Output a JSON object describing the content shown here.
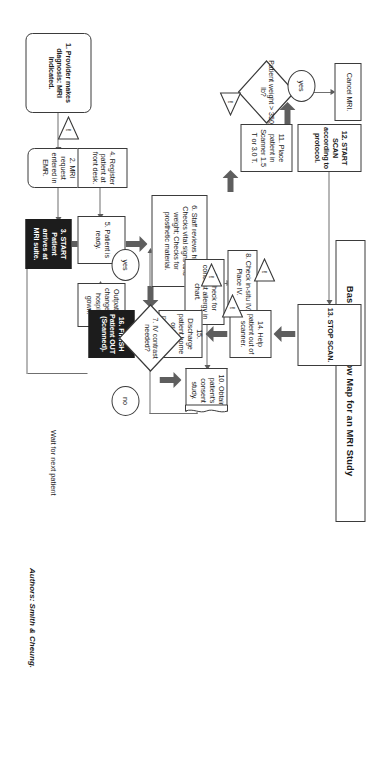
{
  "document": {
    "title": "Basic Process Flow Map for an MRI Study",
    "authors": "Authors: Smith & Cheung.",
    "loop_label": "Wait for next patient"
  },
  "icons": {
    "warning": "!"
  },
  "nodes": [
    {
      "id": "n1",
      "name": "step-1-provider-diagnosis",
      "text": "1. Provider makes diagnosis: MRI Indicated.",
      "shape": "rounded",
      "emphasis": "bold"
    },
    {
      "id": "n2",
      "name": "step-2-mri-request-emr",
      "text": "2. MRI request entered in EMR.",
      "shape": "rounded",
      "emphasis": "normal"
    },
    {
      "id": "n3",
      "name": "step-3-start-patient-arrives",
      "text": "3. START Patient arrives at MRI suite.",
      "shape": "rect",
      "emphasis": "black"
    },
    {
      "id": "n4",
      "name": "step-4-register-front-desk",
      "text": "4. Register patient at front desk.",
      "shape": "rect",
      "emphasis": "normal"
    },
    {
      "id": "n5",
      "name": "step-5-patient-ready",
      "text": "5. Patient is ready.",
      "shape": "rect",
      "emphasis": "normal"
    },
    {
      "id": "nOut",
      "name": "outpatient-gown-change",
      "text": "Outpatient changes to hospital gown.",
      "shape": "rect",
      "emphasis": "normal"
    },
    {
      "id": "n6",
      "name": "step-6-staff-reviews",
      "text": "6. Staff reviews history; Checks vital signs and weight; Checks for prosthetic material.",
      "shape": "rect",
      "emphasis": "normal"
    },
    {
      "id": "n8",
      "name": "step-8-check-iv",
      "text": "8. Check in-situ IV. Place IV.",
      "shape": "rect",
      "emphasis": "normal"
    },
    {
      "id": "n9",
      "name": "step-9-contrast-allergy",
      "text": "9. Check for contrast allergy in chart.",
      "shape": "rect",
      "emphasis": "normal"
    },
    {
      "id": "n10",
      "name": "step-10-obtain-consent",
      "text": "10. Obtain patient's consent study.",
      "shape": "document",
      "emphasis": "normal"
    },
    {
      "id": "n11",
      "name": "step-11-place-in-scanner",
      "text": "11. Place patient in Scanner 1.5 T or 3.0 T.",
      "shape": "rect",
      "emphasis": "normal"
    },
    {
      "id": "nCan",
      "name": "cancel-mri",
      "text": "Cancel MRI.",
      "shape": "rect",
      "emphasis": "normal"
    },
    {
      "id": "n12",
      "name": "step-12-start-scan",
      "text": "12. START SCAN according to protocol.",
      "shape": "rect",
      "emphasis": "semibold"
    },
    {
      "id": "n13",
      "name": "step-13-stop-scan",
      "text": "13. STOP SCAN.",
      "shape": "rect",
      "emphasis": "bold"
    },
    {
      "id": "n14",
      "name": "step-14-help-patient-out",
      "text": "14. Help patient out of scanner.",
      "shape": "rect",
      "emphasis": "normal"
    },
    {
      "id": "n15",
      "name": "step-15-discharge",
      "text": "15. Discharge patient home or to in-patient unit.",
      "shape": "rect",
      "emphasis": "normal"
    },
    {
      "id": "n16",
      "name": "step-16-finish-patient-out",
      "text": "16. FINISH Patient OUT (Scanned).",
      "shape": "rect",
      "emphasis": "black"
    }
  ],
  "decisions": [
    {
      "id": "d7",
      "name": "decision-iv-contrast",
      "text": "7. IV contrast needed?"
    },
    {
      "id": "dw",
      "name": "decision-patient-weight",
      "text": "Patient weight > 350 lb?"
    }
  ],
  "branch_labels": [
    {
      "id": "yes7",
      "name": "branch-label-yes-contrast",
      "text": "yes"
    },
    {
      "id": "no7",
      "name": "branch-label-no-contrast",
      "text": "no"
    },
    {
      "id": "yesw",
      "name": "branch-label-yes-weight",
      "text": "yes"
    }
  ],
  "warnings": [
    {
      "id": "w1",
      "name": "warning-icon-step-1"
    },
    {
      "id": "w6",
      "name": "warning-icon-step-6"
    },
    {
      "id": "w8",
      "name": "warning-icon-step-8"
    },
    {
      "id": "w9",
      "name": "warning-icon-step-9"
    },
    {
      "id": "w11",
      "name": "warning-icon-step-11"
    }
  ],
  "colors": {
    "paper": "#ffffff",
    "stroke": "#3b3b3b",
    "thin_connector": "#6f6f6f",
    "block_arrow": "#5e5e5e",
    "filled_node_bg": "#1c1c1c",
    "filled_node_text": "#ffffff"
  }
}
